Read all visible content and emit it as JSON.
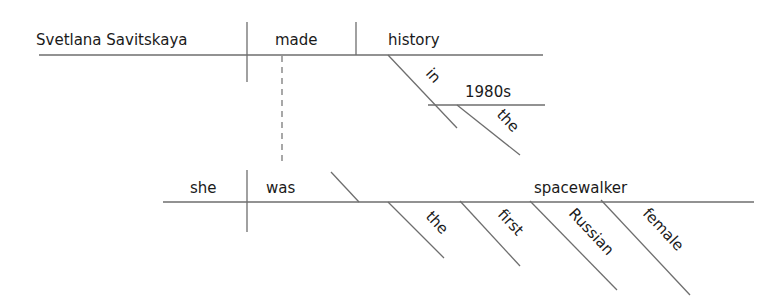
{
  "diagram": {
    "type": "Reed-Kellogg sentence diagram",
    "main_clause": {
      "subject": "Svetlana Savitskaya",
      "verb": "made",
      "direct_object": "history",
      "prepositional_phrase": {
        "preposition": "in",
        "object": "1980s",
        "object_modifier": "the"
      }
    },
    "subordinate_clause": {
      "subject": "she",
      "verb": "was",
      "predicate_nominative": "spacewalker",
      "modifiers": [
        "the",
        "first",
        "Russian",
        "female"
      ]
    },
    "line_color": "#6e6e6e",
    "text_color": "#1a1a1a"
  }
}
